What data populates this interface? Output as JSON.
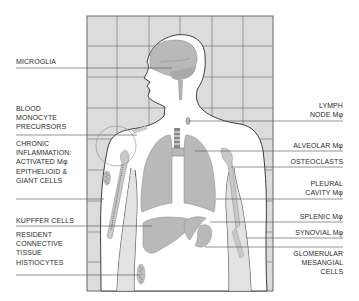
{
  "diagram": {
    "colors": {
      "grid_fill": "#dcdcdc",
      "grid_line": "#5a5a5a",
      "body_fill": "#ffffff",
      "organ_fill": "#b9b9b9",
      "outline": "#2a2a2a",
      "text": "#2a2a2a"
    },
    "left_labels": [
      {
        "id": "microglia",
        "text": "MICROGLIA"
      },
      {
        "id": "blood-monocyte",
        "text": "BLOOD\nMONOCYTE\nPRECURSORS"
      },
      {
        "id": "chronic-inflammation",
        "text": "CHRONIC\nINFLAMMATION:\nACTIVATED Mφ\nEPITHELIOID &\nGIANT CELLS"
      },
      {
        "id": "kupffer",
        "text": "KUPFFER CELLS"
      },
      {
        "id": "histiocytes",
        "text": "RESIDENT\nCONNECTIVE\nTISSUE\nHISTIOCYTES"
      }
    ],
    "right_labels": [
      {
        "id": "lymph-node",
        "text": "LYMPH\nNODE Mφ"
      },
      {
        "id": "alveolar",
        "text": "ALVEOLAR Mφ"
      },
      {
        "id": "osteoclasts",
        "text": "OSTEOCLASTS"
      },
      {
        "id": "pleural",
        "text": "PLEURAL\nCAVITY Mφ"
      },
      {
        "id": "splenic",
        "text": "SPLENIC Mφ"
      },
      {
        "id": "synovial",
        "text": "SYNOVIAL Mφ"
      },
      {
        "id": "glomerular",
        "text": "GLOMERULAR\nMESANGIAL\nCELLS"
      }
    ]
  }
}
